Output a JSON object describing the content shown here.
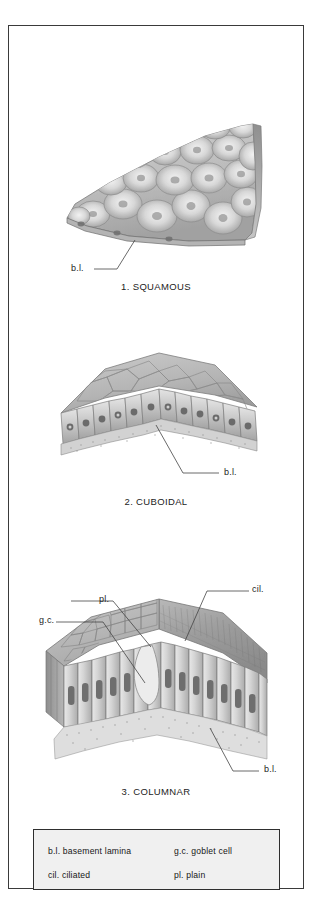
{
  "plate": {
    "title_semantic": "epithelial-tissue-types-plate",
    "background_color": "#ffffff",
    "border_color": "#3a3a3a"
  },
  "figures": [
    {
      "id": "squamous",
      "caption": "1. SQUAMOUS",
      "labels": [
        {
          "key": "bl",
          "text": "b.l."
        }
      ]
    },
    {
      "id": "cuboidal",
      "caption": "2. CUBOIDAL",
      "labels": [
        {
          "key": "bl",
          "text": "b.l."
        }
      ]
    },
    {
      "id": "columnar",
      "caption": "3. COLUMNAR",
      "labels": [
        {
          "key": "pl",
          "text": "pl."
        },
        {
          "key": "gc",
          "text": "g.c."
        },
        {
          "key": "cil",
          "text": "cil."
        },
        {
          "key": "bl",
          "text": "b.l."
        }
      ]
    }
  ],
  "legend": {
    "background_color": "#f0f0f0",
    "border_color": "#2e2e2e",
    "entries": [
      {
        "row": 0,
        "col": 0,
        "text": "b.l. basement lamina"
      },
      {
        "row": 0,
        "col": 1,
        "text": "g.c. goblet cell"
      },
      {
        "row": 1,
        "col": 0,
        "text": "cil. ciliated"
      },
      {
        "row": 1,
        "col": 1,
        "text": "pl. plain"
      }
    ]
  }
}
